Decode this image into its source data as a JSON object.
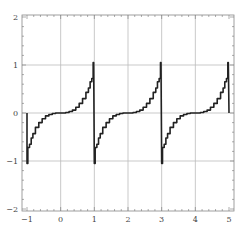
{
  "chart_data": {
    "type": "line",
    "title": "",
    "xlabel": "",
    "ylabel": "",
    "xlim": [
      -1,
      5
    ],
    "ylim": [
      -2,
      2
    ],
    "grid": true,
    "legend": null,
    "x_ticks": [
      -1,
      0,
      1,
      2,
      3,
      4,
      5
    ],
    "y_ticks": [
      -2,
      -1,
      0,
      1,
      2
    ],
    "x_tick_labels": [
      "−1",
      "0",
      "1",
      "2",
      "3",
      "4",
      "5"
    ],
    "y_tick_labels": [
      "−2",
      "−1",
      "0",
      "1",
      "2"
    ],
    "series": [
      {
        "name": "periodic staircase curve",
        "color": "#222222",
        "period": 2,
        "description": "Stepped approximation of a tangent-like curve repeating with period 2, rising to about 1.05 just before odd x and dropping to about -1.05 just after",
        "x": [
          -1.0,
          -0.95,
          -0.9,
          -0.85,
          -0.8,
          -0.7,
          -0.6,
          -0.5,
          -0.4,
          -0.3,
          -0.2,
          -0.1,
          0.0,
          0.1,
          0.2,
          0.3,
          0.4,
          0.5,
          0.6,
          0.7,
          0.8,
          0.85,
          0.9,
          0.95,
          0.98
        ],
        "y": [
          -1.05,
          -0.72,
          -0.65,
          -0.52,
          -0.43,
          -0.3,
          -0.2,
          -0.12,
          -0.06,
          -0.03,
          -0.01,
          0.0,
          0.0,
          0.0,
          0.01,
          0.03,
          0.06,
          0.12,
          0.2,
          0.3,
          0.43,
          0.52,
          0.65,
          0.72,
          1.05
        ]
      }
    ]
  },
  "axes": {
    "frame_color": "#888888",
    "grid_color": "#bbbbbb",
    "line_color": "#222222"
  }
}
